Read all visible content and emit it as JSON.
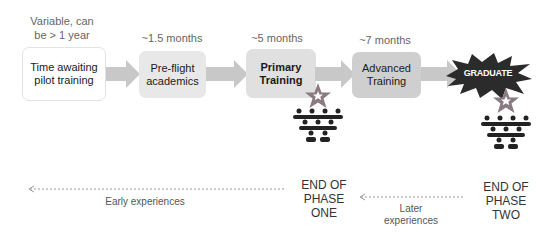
{
  "stages": [
    {
      "duration": "Variable, can be > 1 year",
      "label_line1": "Time awaiting",
      "label_line2": "pilot training",
      "fill": "#ffffff"
    },
    {
      "duration": "~1.5 months",
      "label_line1": "Pre-flight",
      "label_line2": "academics",
      "fill": "#e8e8e8"
    },
    {
      "duration": "~5 months",
      "label_line1": "Primary",
      "label_line2": "Training",
      "fill": "#e0e0e0"
    },
    {
      "duration": "~7 months",
      "label_line1": "Advanced",
      "label_line2": "Training",
      "fill": "#cfcfcf"
    }
  ],
  "stage0_duration_line1": "Variable, can",
  "stage0_duration_line2": "be > 1 year",
  "graduate": {
    "label": "GRADUATE",
    "fill": "#2b2b2b"
  },
  "icons": {
    "star": "star-icon",
    "people": "people-group-icon",
    "color_star": "#8a7a82"
  },
  "phases": {
    "one": {
      "line1": "END OF",
      "line2": "PHASE",
      "line3": "ONE"
    },
    "two": {
      "line1": "END OF",
      "line2": "PHASE",
      "line3": "TWO"
    }
  },
  "experiences": {
    "early": "Early experiences",
    "later_line1": "Later",
    "later_line2": "experiences"
  }
}
